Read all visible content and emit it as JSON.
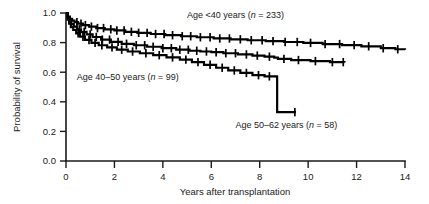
{
  "chart_data": {
    "type": "line",
    "subtype": "kaplan-meier-survival",
    "title": "",
    "xlabel": "Years after transplantation",
    "ylabel": "Probability of survival",
    "xlim": [
      0,
      14
    ],
    "ylim": [
      0.0,
      1.0
    ],
    "xticks": [
      "0",
      "2",
      "4",
      "6",
      "8",
      "10",
      "12",
      "14"
    ],
    "xtick_values": [
      0,
      2,
      4,
      6,
      8,
      10,
      12,
      14
    ],
    "yticks": [
      "0.0",
      "0.2",
      "0.4",
      "0.6",
      "0.8",
      "1.0"
    ],
    "ytick_values": [
      0.0,
      0.2,
      0.4,
      0.6,
      0.8,
      1.0
    ],
    "grid": false,
    "legend_position": "inline-annotations",
    "series": [
      {
        "name": "Age <40 years",
        "label": "Age <40 years (n = 233)",
        "label_prefix": "Age <40 years (",
        "label_italic": "n",
        "label_suffix": " = 233)",
        "n": 233,
        "color": "#000000",
        "annotation_x": 7.0,
        "annotation_y": 0.965,
        "steps_x": [
          0.0,
          0.08,
          0.16,
          0.25,
          0.35,
          0.5,
          0.7,
          0.95,
          1.25,
          1.6,
          2.0,
          2.45,
          2.95,
          3.5,
          4.1,
          4.75,
          5.4,
          6.1,
          6.8,
          7.5,
          8.25,
          9.0,
          9.8,
          10.6,
          11.4,
          12.2,
          13.0,
          13.6,
          14.0
        ],
        "steps_y": [
          1.0,
          0.975,
          0.96,
          0.948,
          0.938,
          0.928,
          0.918,
          0.908,
          0.898,
          0.89,
          0.882,
          0.873,
          0.866,
          0.858,
          0.85,
          0.843,
          0.836,
          0.828,
          0.822,
          0.816,
          0.81,
          0.804,
          0.798,
          0.79,
          0.783,
          0.775,
          0.762,
          0.755,
          0.752
        ],
        "censor_x": [
          0.45,
          0.62,
          0.8,
          1.05,
          1.3,
          1.55,
          1.85,
          2.1,
          2.4,
          2.7,
          3.0,
          3.35,
          3.7,
          4.05,
          4.4,
          4.8,
          5.15,
          5.55,
          5.95,
          6.35,
          6.75,
          7.2,
          7.65,
          8.1,
          8.55,
          9.05,
          9.55,
          10.1,
          10.7,
          11.3,
          11.9,
          12.5,
          13.1,
          13.7
        ],
        "final_value": 0.75
      },
      {
        "name": "Age 40-50 years",
        "label": "Age 40–50 years (n = 99)",
        "label_prefix": "Age 40–50 years (",
        "label_italic": "n",
        "label_suffix": " = 99)",
        "n": 99,
        "color": "#000000",
        "annotation_x": 2.55,
        "annotation_y": 0.545,
        "steps_x": [
          0.0,
          0.07,
          0.14,
          0.22,
          0.32,
          0.45,
          0.62,
          0.85,
          1.1,
          1.45,
          1.85,
          2.3,
          2.8,
          3.35,
          3.95,
          4.55,
          5.1,
          5.55,
          6.0,
          6.5,
          7.1,
          7.7,
          8.2,
          8.6,
          8.75,
          9.3,
          10.1,
          10.9,
          11.5
        ],
        "steps_y": [
          1.0,
          0.968,
          0.945,
          0.925,
          0.908,
          0.89,
          0.872,
          0.855,
          0.838,
          0.82,
          0.805,
          0.792,
          0.782,
          0.772,
          0.762,
          0.752,
          0.745,
          0.74,
          0.735,
          0.728,
          0.72,
          0.712,
          0.705,
          0.698,
          0.69,
          0.682,
          0.675,
          0.668,
          0.665
        ],
        "censor_x": [
          0.55,
          0.75,
          1.0,
          1.25,
          1.5,
          1.8,
          2.15,
          2.5,
          2.9,
          3.25,
          3.6,
          4.0,
          4.35,
          4.7,
          5.05,
          5.4,
          5.8,
          6.2,
          6.6,
          7.0,
          7.45,
          7.9,
          8.4,
          9.0,
          9.6,
          10.3,
          11.0,
          11.45
        ],
        "final_value": 0.665
      },
      {
        "name": "Age 50-62 years",
        "label": "Age 50–62 years (n = 58)",
        "label_prefix": "Age 50–62 years (",
        "label_italic": "n",
        "label_suffix": " = 58)",
        "n": 58,
        "color": "#000000",
        "annotation_x": 9.1,
        "annotation_y": 0.225,
        "steps_x": [
          0.0,
          0.06,
          0.13,
          0.2,
          0.3,
          0.42,
          0.58,
          0.78,
          1.05,
          1.35,
          1.7,
          2.1,
          2.55,
          3.05,
          3.6,
          4.15,
          4.7,
          5.2,
          5.7,
          6.2,
          6.7,
          7.2,
          7.7,
          8.2,
          8.7,
          8.72,
          9.5
        ],
        "steps_y": [
          1.0,
          0.955,
          0.928,
          0.905,
          0.885,
          0.862,
          0.84,
          0.818,
          0.798,
          0.782,
          0.768,
          0.752,
          0.74,
          0.728,
          0.715,
          0.7,
          0.685,
          0.668,
          0.65,
          0.63,
          0.612,
          0.595,
          0.58,
          0.572,
          0.57,
          0.33,
          0.33
        ],
        "censor_x": [
          0.5,
          0.7,
          0.95,
          1.2,
          1.48,
          1.9,
          2.3,
          2.75,
          3.3,
          3.85,
          4.4,
          4.95,
          5.45,
          5.95,
          6.45,
          6.95,
          7.45,
          7.95,
          8.4,
          9.45
        ],
        "final_value": 0.33
      }
    ]
  },
  "axes": {
    "y_axis_title": "Probability of survival",
    "x_axis_title": "Years after transplantation"
  }
}
